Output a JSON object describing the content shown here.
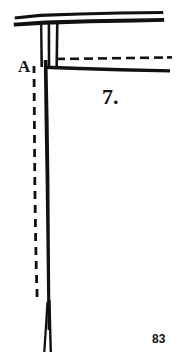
{
  "document": {
    "type": "scanned-book-figure",
    "page_number": "83",
    "background_color": "#ffffff",
    "ink_color": "#111111"
  },
  "figure": {
    "caption_number": "7.",
    "point_label": "A",
    "elements": {
      "top_beam_upper_label": "top-beam-upper-stroke",
      "top_beam_lower_label": "top-beam-lower-stroke",
      "post_left_label": "post-left-stroke",
      "post_middle_label": "post-middle-stroke",
      "post_right_label": "post-right-stroke",
      "dashed_horizontal_label": "dashed-reference-line-horizontal",
      "dashed_vertical_label": "dashed-reference-line-vertical",
      "lower_beam_label": "lower-beam-stroke",
      "main_post_label": "main-vertical-post",
      "post_foot_label": "post-foot-split"
    }
  },
  "colors": {
    "ink": "#111111",
    "paper": "#ffffff"
  }
}
